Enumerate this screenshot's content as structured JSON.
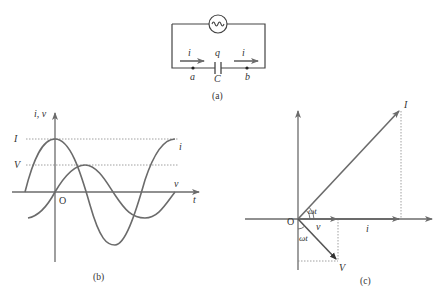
{
  "figure": {
    "panels": [
      {
        "id": "a",
        "caption": "(a)",
        "title": "AC source with capacitor circuit"
      },
      {
        "id": "b",
        "caption": "(b)",
        "title": "Current and voltage vs time"
      },
      {
        "id": "c",
        "caption": "(c)",
        "title": "Phasor diagram"
      }
    ]
  },
  "circuit": {
    "caption": "(a)",
    "source_symbol": "~",
    "current_label_left": "i",
    "current_label_right": "i",
    "charge_label": "q",
    "capacitor_label": "C",
    "node_a": "a",
    "node_b": "b"
  },
  "graph": {
    "caption": "(b)",
    "y_axis_label": "i, v",
    "x_axis_label": "t",
    "origin_label": "O",
    "amplitude_i_label": "I",
    "amplitude_v_label": "V",
    "curve_i_label": "i",
    "curve_v_label": "v"
  },
  "phasor": {
    "caption": "(c)",
    "origin_label": "O",
    "phasor_I_label": "I",
    "phasor_V_label": "V",
    "proj_i_label": "i",
    "proj_v_label": "v",
    "angle_upper_label": "ωt",
    "angle_lower_label": "ωt"
  },
  "colors": {
    "line": "#6b6b6b",
    "text": "#333333",
    "dotted": "#888888"
  }
}
